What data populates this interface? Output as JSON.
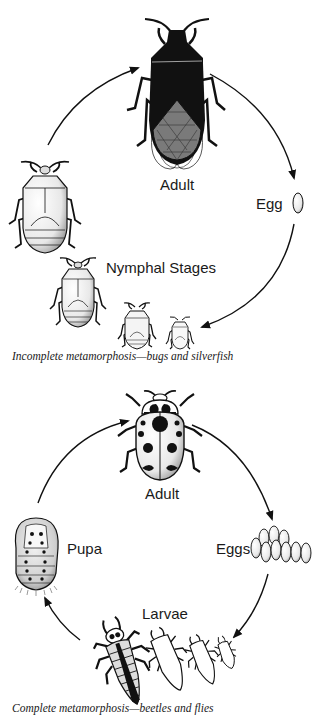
{
  "diagrams": [
    {
      "id": "incomplete",
      "caption": "Incomplete metamorphosis—bugs and silverfish",
      "stages": {
        "adult": "Adult",
        "egg": "Egg",
        "nymphs": "Nymphal Stages"
      }
    },
    {
      "id": "complete",
      "caption": "Complete metamorphosis—beetles and flies",
      "stages": {
        "adult": "Adult",
        "eggs": "Eggs",
        "larvae": "Larvae",
        "pupa": "Pupa"
      }
    }
  ],
  "colors": {
    "ink": "#111111",
    "background": "#ffffff",
    "wing_gray": "#7a7a7a",
    "shade": "#d9d9d9"
  }
}
